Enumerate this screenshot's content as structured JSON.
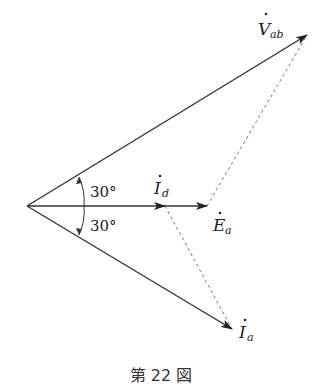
{
  "diagram": {
    "type": "phasor",
    "origin": [
      27,
      206
    ],
    "vectors": [
      {
        "id": "V_ab",
        "label_main": "V",
        "label_sub": "ab",
        "tip": [
          307,
          35
        ],
        "style": "solid"
      },
      {
        "id": "I_d",
        "label_main": "I",
        "label_sub": "d",
        "tip": [
          165,
          206
        ],
        "style": "solid"
      },
      {
        "id": "E_a",
        "label_main": "E",
        "label_sub": "a",
        "tip": [
          207,
          206
        ],
        "style": "solid"
      },
      {
        "id": "I_a",
        "label_main": "I",
        "label_sub": "a",
        "tip": [
          232,
          329
        ],
        "style": "solid"
      }
    ],
    "angles": [
      {
        "label": "30°",
        "between": [
          "E_a",
          "V_ab"
        ]
      },
      {
        "label": "30°",
        "between": [
          "E_a",
          "I_a"
        ]
      }
    ],
    "dashed_lines": [
      {
        "from": "E_a_tip",
        "to": "V_ab_tip"
      },
      {
        "from": "I_d_tip",
        "to": "I_a_tip"
      }
    ],
    "colors": {
      "line": "#333333",
      "dashed": "#777777"
    }
  },
  "caption": "第 22 図"
}
